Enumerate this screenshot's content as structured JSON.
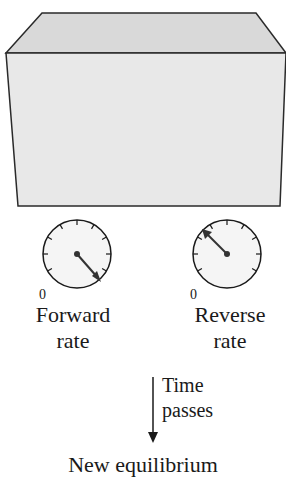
{
  "diagram": {
    "container": {
      "shape": "box",
      "fill": "#e6e6e6",
      "top_fill": "#dadada",
      "stroke": "#2a2a2a"
    },
    "gauges": [
      {
        "id": "forward",
        "zero_label": "0",
        "label_line1": "Forward",
        "label_line2": "rate",
        "needle_direction": "lower-right"
      },
      {
        "id": "reverse",
        "zero_label": "0",
        "label_line1": "Reverse",
        "label_line2": "rate",
        "needle_direction": "upper-left"
      }
    ],
    "arrow": {
      "label_line1": "Time",
      "label_line2": "passes"
    },
    "caption": "New equilibrium"
  }
}
